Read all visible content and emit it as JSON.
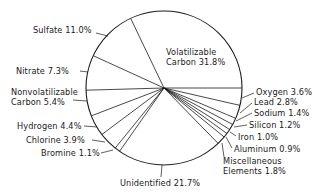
{
  "chart_data": {
    "type": "pie",
    "title": "",
    "start_angle_deg": 0,
    "direction": "counterclockwise",
    "slices": [
      {
        "label": "Volatilizable Carbon",
        "value": 31.8,
        "text": "Volatilizable|Carbon 31.8%"
      },
      {
        "label": "Sulfate",
        "value": 11.0,
        "text": "Sulfate 11.0%"
      },
      {
        "label": "Nitrate",
        "value": 7.3,
        "text": "Nitrate 7.3%"
      },
      {
        "label": "Nonvolatilizable Carbon",
        "value": 5.4,
        "text": "Nonvolatilizable|Carbon 5.4%"
      },
      {
        "label": "Hydrogen",
        "value": 4.4,
        "text": "Hydrogen 4.4%"
      },
      {
        "label": "Chlorine",
        "value": 3.9,
        "text": "Chlorine 3.9%"
      },
      {
        "label": "Bromine",
        "value": 1.1,
        "text": "Bromine 1.1%"
      },
      {
        "label": "Unidentified",
        "value": 21.7,
        "text": "Unidentified 21.7%"
      },
      {
        "label": "Miscellaneous Elements",
        "value": 1.8,
        "text": "Miscellaneous|Elements 1.8%"
      },
      {
        "label": "Aluminum",
        "value": 0.9,
        "text": "Aluminum 0.9%"
      },
      {
        "label": "Iron",
        "value": 1.0,
        "text": "Iron 1.0%"
      },
      {
        "label": "Silicon",
        "value": 1.2,
        "text": "Silicon 1.2%"
      },
      {
        "label": "Sodium",
        "value": 1.4,
        "text": "Sodium 1.4%"
      },
      {
        "label": "Lead",
        "value": 2.8,
        "text": "Lead 2.8%"
      },
      {
        "label": "Oxygen",
        "value": 3.6,
        "text": "Oxygen 3.6%"
      }
    ],
    "units": "%"
  },
  "labels": {
    "volatilizable_carbon": [
      "Volatilizable",
      "Carbon 31.8%"
    ],
    "sulfate": "Sulfate 11.0%",
    "nitrate": "Nitrate 7.3%",
    "nonvolatilizable_carbon": [
      "Nonvolatilizable",
      "Carbon 5.4%"
    ],
    "hydrogen": "Hydrogen 4.4%",
    "chlorine": "Chlorine 3.9%",
    "bromine": "Bromine 1.1%",
    "unidentified": "Unidentified 21.7%",
    "miscellaneous": [
      "Miscellaneous",
      "Elements 1.8%"
    ],
    "aluminum": "Aluminum 0.9%",
    "iron": "Iron 1.0%",
    "silicon": "Silicon 1.2%",
    "sodium": "Sodium 1.4%",
    "lead": "Lead 2.8%",
    "oxygen": "Oxygen 3.6%"
  },
  "colors": {
    "line": "#1a1a1a",
    "background": "#ffffff"
  }
}
